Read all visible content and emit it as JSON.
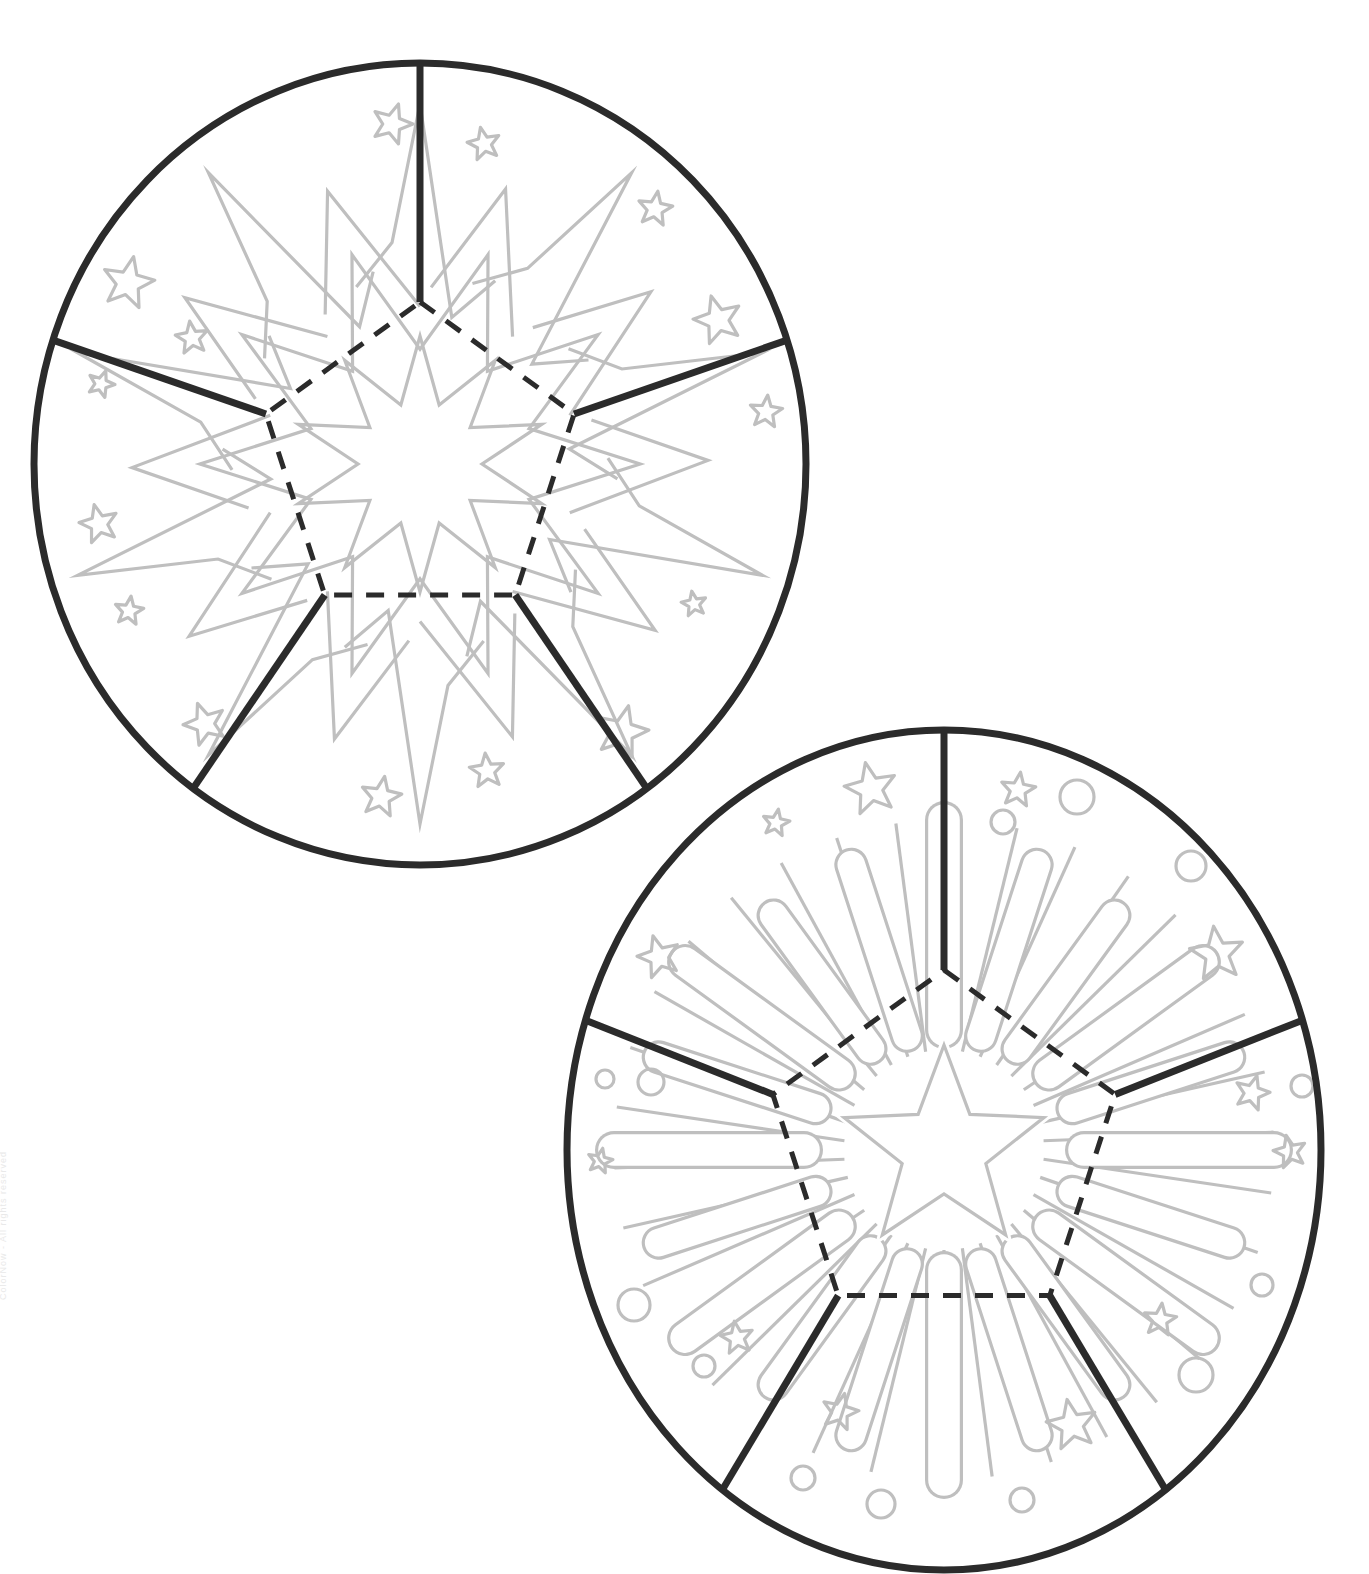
{
  "document": {
    "title": "Firework Rosette Coloring Templates",
    "page_background": "#ffffff",
    "width": 1369,
    "height": 1574,
    "watermark_text": "ColorNow - All rights reserved"
  },
  "palette": {
    "outline_dark": "#2b2b2b",
    "artwork_gray": "#bfbfbf",
    "dash_dark": "#2b2b2b",
    "fill_none": "none"
  },
  "stroke_widths": {
    "circle_rim": 7,
    "cut_line": 7,
    "fold_dash": 5,
    "artwork": 3.2
  },
  "dash_pattern": {
    "fold_dash_array": "18 14"
  },
  "figures": [
    {
      "id": "rosette-starburst",
      "label": "Starburst rosette template",
      "center": {
        "x": 420,
        "y": 464
      },
      "radius": {
        "rx": 386,
        "ry": 401
      },
      "segments": 5,
      "pentagon_radius": 162,
      "pentagon_rotation_deg": -90,
      "cut_line_count": 5,
      "motif": "zigzag-starburst",
      "motif_description": "Large ten-point zigzag starburst with inner ten-point star, surrounded by scattered outline stars",
      "starburst": {
        "points": 10,
        "outer_radius": 360,
        "inner_radius": 150,
        "zigzag_offset": 38
      },
      "inner_star": {
        "points": 10,
        "outer_radius": 128,
        "inner_radius": 62
      },
      "scatter_stars": [
        {
          "x": 128,
          "y": 283,
          "r": 27,
          "rot": 12
        },
        {
          "x": 192,
          "y": 338,
          "r": 17,
          "rot": -8
        },
        {
          "x": 101,
          "y": 384,
          "r": 14,
          "rot": 20
        },
        {
          "x": 99,
          "y": 524,
          "r": 20,
          "rot": -14
        },
        {
          "x": 129,
          "y": 611,
          "r": 15,
          "rot": 8
        },
        {
          "x": 205,
          "y": 724,
          "r": 22,
          "rot": -20
        },
        {
          "x": 381,
          "y": 797,
          "r": 21,
          "rot": 10
        },
        {
          "x": 487,
          "y": 771,
          "r": 18,
          "rot": -6
        },
        {
          "x": 622,
          "y": 732,
          "r": 27,
          "rot": 14
        },
        {
          "x": 694,
          "y": 604,
          "r": 13,
          "rot": -10
        },
        {
          "x": 766,
          "y": 412,
          "r": 17,
          "rot": 6
        },
        {
          "x": 718,
          "y": 320,
          "r": 25,
          "rot": -16
        },
        {
          "x": 655,
          "y": 209,
          "r": 18,
          "rot": 9
        },
        {
          "x": 484,
          "y": 144,
          "r": 17,
          "rot": -12
        },
        {
          "x": 392,
          "y": 124,
          "r": 21,
          "rot": 18
        }
      ]
    },
    {
      "id": "rosette-firework",
      "label": "Firework burst rosette template",
      "center": {
        "x": 944,
        "y": 1150
      },
      "radius": {
        "rx": 377,
        "ry": 420
      },
      "segments": 5,
      "pentagon_radius": 180,
      "pentagon_rotation_deg": -90,
      "cut_line_count": 5,
      "motif": "capsule-ray-firework",
      "motif_description": "Central five point star with long thin rays, ringed by rounded capsule firework trails, scattered outline stars and circles",
      "center_star": {
        "points": 5,
        "outer_radius": 105,
        "inner_radius": 44,
        "rotation_deg": -90
      },
      "ray_count": 34,
      "ray_inner_radius": 100,
      "ray_outer_radius": 330,
      "capsules": [
        {
          "angle": -90,
          "inner": 120,
          "outer": 330,
          "width": 38
        },
        {
          "angle": -72,
          "inner": 120,
          "outer": 300,
          "width": 34
        },
        {
          "angle": -54,
          "inner": 125,
          "outer": 290,
          "width": 34
        },
        {
          "angle": -36,
          "inner": 130,
          "outer": 320,
          "width": 36
        },
        {
          "angle": -18,
          "inner": 135,
          "outer": 300,
          "width": 34
        },
        {
          "angle": 0,
          "inner": 140,
          "outer": 330,
          "width": 38
        },
        {
          "angle": 18,
          "inner": 135,
          "outer": 300,
          "width": 34
        },
        {
          "angle": 36,
          "inner": 130,
          "outer": 320,
          "width": 36
        },
        {
          "angle": 54,
          "inner": 125,
          "outer": 290,
          "width": 34
        },
        {
          "angle": 72,
          "inner": 120,
          "outer": 300,
          "width": 34
        },
        {
          "angle": 90,
          "inner": 120,
          "outer": 330,
          "width": 38
        },
        {
          "angle": 108,
          "inner": 120,
          "outer": 300,
          "width": 34
        },
        {
          "angle": 126,
          "inner": 125,
          "outer": 290,
          "width": 34
        },
        {
          "angle": 144,
          "inner": 130,
          "outer": 320,
          "width": 36
        },
        {
          "angle": 162,
          "inner": 135,
          "outer": 300,
          "width": 34
        },
        {
          "angle": 180,
          "inner": 140,
          "outer": 330,
          "width": 38
        },
        {
          "angle": 198,
          "inner": 135,
          "outer": 300,
          "width": 34
        },
        {
          "angle": 216,
          "inner": 130,
          "outer": 320,
          "width": 36
        },
        {
          "angle": 234,
          "inner": 125,
          "outer": 290,
          "width": 34
        },
        {
          "angle": 252,
          "inner": 120,
          "outer": 300,
          "width": 34
        }
      ],
      "scatter_stars": [
        {
          "x": 776,
          "y": 823,
          "r": 14,
          "rot": 10
        },
        {
          "x": 871,
          "y": 789,
          "r": 27,
          "rot": -12
        },
        {
          "x": 1018,
          "y": 790,
          "r": 18,
          "rot": 8
        },
        {
          "x": 659,
          "y": 957,
          "r": 22,
          "rot": -16
        },
        {
          "x": 600,
          "y": 1161,
          "r": 13,
          "rot": 12
        },
        {
          "x": 737,
          "y": 1338,
          "r": 17,
          "rot": -9
        },
        {
          "x": 840,
          "y": 1412,
          "r": 19,
          "rot": 14
        },
        {
          "x": 1072,
          "y": 1425,
          "r": 26,
          "rot": -11
        },
        {
          "x": 1160,
          "y": 1320,
          "r": 17,
          "rot": 7
        },
        {
          "x": 1290,
          "y": 1152,
          "r": 17,
          "rot": -13
        },
        {
          "x": 1252,
          "y": 1093,
          "r": 18,
          "rot": 16
        },
        {
          "x": 1217,
          "y": 954,
          "r": 28,
          "rot": -7
        }
      ],
      "scatter_circles": [
        {
          "x": 1077,
          "y": 797,
          "r": 17
        },
        {
          "x": 1003,
          "y": 822,
          "r": 12
        },
        {
          "x": 1191,
          "y": 866,
          "r": 15
        },
        {
          "x": 1302,
          "y": 1086,
          "r": 11
        },
        {
          "x": 605,
          "y": 1079,
          "r": 9
        },
        {
          "x": 651,
          "y": 1082,
          "r": 13
        },
        {
          "x": 634,
          "y": 1305,
          "r": 16
        },
        {
          "x": 704,
          "y": 1366,
          "r": 11
        },
        {
          "x": 803,
          "y": 1478,
          "r": 12
        },
        {
          "x": 881,
          "y": 1504,
          "r": 14
        },
        {
          "x": 1022,
          "y": 1500,
          "r": 12
        },
        {
          "x": 1262,
          "y": 1285,
          "r": 11
        },
        {
          "x": 1196,
          "y": 1375,
          "r": 17
        }
      ]
    }
  ]
}
